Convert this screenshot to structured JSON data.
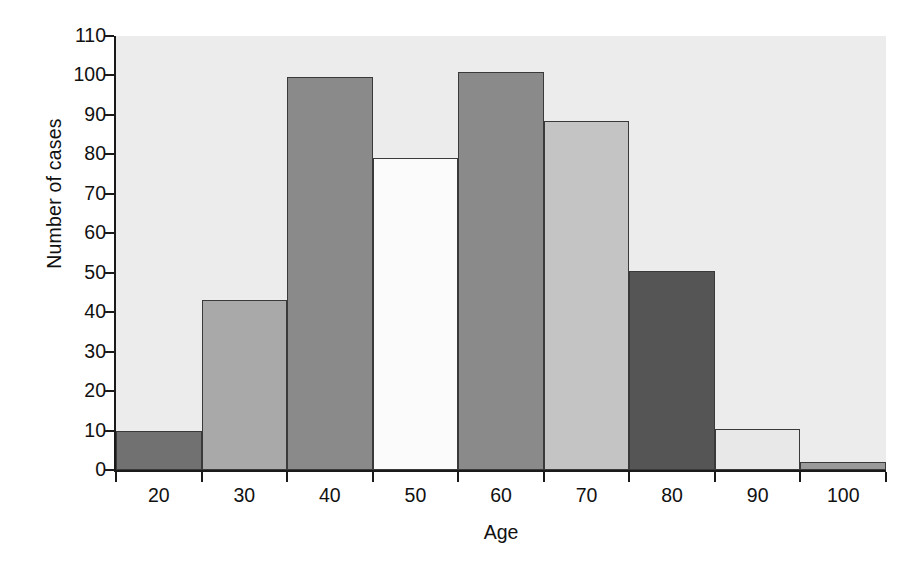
{
  "chart_data": {
    "type": "bar",
    "title": "",
    "subtitle": "",
    "xlabel": "Age",
    "ylabel": "Number of cases",
    "categories": [
      "20",
      "30",
      "40",
      "50",
      "60",
      "70",
      "80",
      "90",
      "100"
    ],
    "values": [
      10,
      43,
      99.5,
      79,
      101,
      88.5,
      50.5,
      10.5,
      2
    ],
    "series": [
      {
        "name": "Number of cases",
        "values": [
          10,
          43,
          99.5,
          79,
          101,
          88.5,
          50.5,
          10.5,
          2
        ]
      }
    ],
    "bar_colors": [
      "#717171",
      "#a9a9a9",
      "#8a8a8a",
      "#fbfbfb",
      "#8a8a8a",
      "#c4c4c4",
      "#555555",
      "#e8e8e8",
      "#9a9a9a"
    ],
    "bar_edge_color": "#3a3a3a",
    "plot_background": "#ececec",
    "figure_background": "#ffffff",
    "axis_color": "#1a1a1a",
    "grid": false,
    "legend": null,
    "legend_position": "none",
    "xlim": [
      15,
      105
    ],
    "ylim": [
      0,
      110
    ],
    "ytick_labels": [
      "0",
      "10",
      "20",
      "30",
      "40",
      "50",
      "60",
      "70",
      "80",
      "90",
      "100",
      "110"
    ],
    "ytick_values": [
      0,
      10,
      20,
      30,
      40,
      50,
      60,
      70,
      80,
      90,
      100,
      110
    ],
    "xtick_labels": [
      "20",
      "30",
      "40",
      "50",
      "60",
      "70",
      "80",
      "90",
      "100"
    ],
    "xtick_values": [
      20,
      30,
      40,
      50,
      60,
      70,
      80,
      90,
      100
    ],
    "annotations": []
  }
}
